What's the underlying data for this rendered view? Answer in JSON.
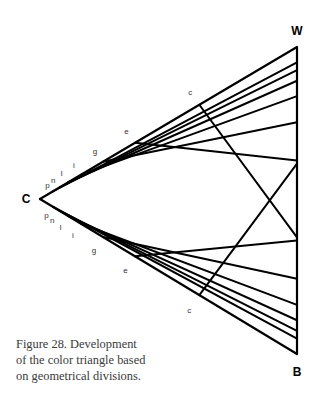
{
  "vertices": {
    "W": {
      "label": "W",
      "x": 297,
      "y": 47
    },
    "C": {
      "label": "C",
      "x": 40,
      "y": 199
    },
    "B": {
      "label": "B",
      "x": 297,
      "y": 354
    }
  },
  "division_fractions": [
    0.62,
    0.37,
    0.245,
    0.16,
    0.11,
    0.075,
    0.05
  ],
  "top_edge_labels": [
    "c",
    "e",
    "g",
    "i",
    "l",
    "n",
    "p"
  ],
  "bottom_edge_labels": [
    "c",
    "e",
    "g",
    "i",
    "l",
    "n",
    "p"
  ],
  "caption": {
    "line1": "Figure 28. Development",
    "line2": "of the color triangle based",
    "line3": "on geometrical divisions."
  },
  "colors": {
    "line": "#000000",
    "caption": "#3a3a3a",
    "label": "#333333"
  }
}
